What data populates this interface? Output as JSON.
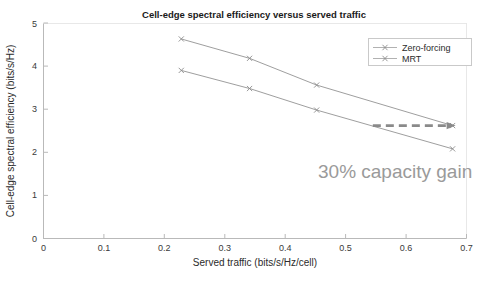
{
  "chart_data": {
    "type": "line",
    "title": "Cell-edge spectral efficiency versus served traffic",
    "xlabel": "Served traffic (bits/s/Hz/cell)",
    "ylabel": "Cell-edge spectral efficiency (bits/s/Hz)",
    "xlim": [
      0,
      0.7
    ],
    "ylim": [
      0,
      5
    ],
    "xticks": [
      0,
      0.1,
      0.2,
      0.3,
      0.4,
      0.5,
      0.6,
      0.7
    ],
    "xtick_labels": [
      "0",
      "0.1",
      "0.2",
      "0.3",
      "0.4",
      "0.5",
      "0.6",
      "0.7"
    ],
    "yticks": [
      0,
      1,
      2,
      3,
      4,
      5
    ],
    "ytick_labels": [
      "0",
      "1",
      "2",
      "3",
      "4",
      "5"
    ],
    "grid": false,
    "legend_position": "upper right",
    "marker": "x",
    "series": [
      {
        "name": "Zero-forcing",
        "color": "#8c8c8c",
        "x": [
          0.228,
          0.341,
          0.452,
          0.677
        ],
        "values": [
          4.63,
          4.18,
          3.56,
          2.62
        ]
      },
      {
        "name": "MRT",
        "color": "#8c8c8c",
        "x": [
          0.228,
          0.341,
          0.452,
          0.677
        ],
        "values": [
          3.9,
          3.48,
          2.98,
          2.08
        ]
      }
    ],
    "annotations": [
      {
        "name": "capacity-gain-label",
        "text": "30% capacity gain",
        "x": 0.5,
        "y": 1.55,
        "color": "#9a9a9a"
      },
      {
        "name": "capacity-gain-arrow",
        "style": "dashed-arrow",
        "x_start": 0.545,
        "x_end": 0.677,
        "y": 2.62,
        "color": "#8a8a8a"
      }
    ]
  },
  "legend": {
    "items": [
      {
        "label": "Zero-forcing"
      },
      {
        "label": "MRT"
      }
    ]
  },
  "colors": {
    "axis": "#b9b9b9",
    "text": "#2b2b2b",
    "series": "#8c8c8c",
    "annotation": "#9a9a9a",
    "background": "#ffffff"
  }
}
